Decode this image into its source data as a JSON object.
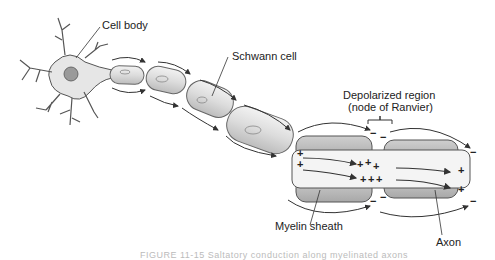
{
  "labels": {
    "cell_body": "Cell body",
    "schwann_cell": "Schwann cell",
    "depolarized_region_line1": "Depolarized region",
    "depolarized_region_line2": "(node of Ranvier)",
    "myelin_sheath": "Myelin sheath",
    "axon": "Axon"
  },
  "charges": {
    "positive": "+",
    "negative": "−"
  },
  "caption": "FIGURE 11-15 Saltatory conduction along myelinated axons"
}
